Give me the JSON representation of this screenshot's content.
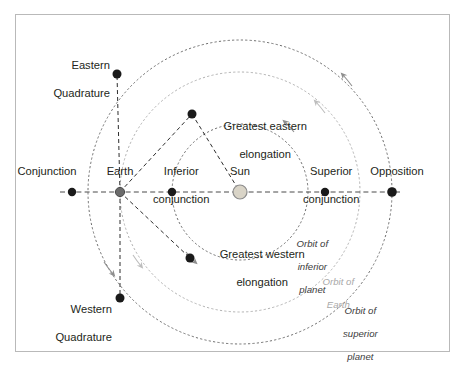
{
  "diagram": {
    "background_color": "#ffffff",
    "border_color": "#b9b9b9",
    "sun": {
      "label": "Sun",
      "fill_color": "#d9d4c7",
      "stroke_color": "#8c8c8c",
      "cx": 240,
      "cy": 192,
      "r": 7
    },
    "earth": {
      "label": "Earth",
      "color": "#6b6b6b",
      "cx": 120,
      "cy": 192,
      "r": 4.5
    },
    "orbits": [
      {
        "name": "orbit-inferior-planet",
        "label": "Orbit of\ninferior\nplanet",
        "label_line1": "Orbit of",
        "label_line2": "inferior",
        "label_line3": "planet",
        "color": "#707070",
        "radius": 68,
        "style": "dotted"
      },
      {
        "name": "orbit-earth",
        "label": "Orbit of\nEarth",
        "label_line1": "Orbit of",
        "label_line2": "Earth",
        "color": "#b2b2b2",
        "radius": 120,
        "style": "dotted"
      },
      {
        "name": "orbit-superior-planet",
        "label": "Orbit of\nsuperior\nplanet",
        "label_line1": "Orbit of",
        "label_line2": "superior",
        "label_line3": "planet",
        "color": "#707070",
        "radius": 152,
        "style": "dotted"
      }
    ],
    "orbit_direction": "counterclockwise",
    "points": [
      {
        "name": "conjunction",
        "label_line1": "Conjunction",
        "label_line2": "",
        "x": 72,
        "y": 192
      },
      {
        "name": "inferior-conjunction",
        "label_line1": "Inferior",
        "label_line2": "conjunction",
        "x": 172,
        "y": 192
      },
      {
        "name": "superior-conjunction",
        "label_line1": "Superior",
        "label_line2": "conjunction",
        "x": 325,
        "y": 192
      },
      {
        "name": "opposition",
        "label_line1": "Opposition",
        "label_line2": "",
        "x": 392,
        "y": 192
      },
      {
        "name": "eastern-quadrature",
        "label_line1": "Eastern",
        "label_line2": "Quadrature",
        "x": 117,
        "y": 74
      },
      {
        "name": "western-quadrature",
        "label_line1": "Western",
        "label_line2": "Quadrature",
        "x": 120,
        "y": 298
      },
      {
        "name": "greatest-eastern-elongation",
        "label_line1": "Greatest eastern",
        "label_line2": "elongation",
        "x": 192,
        "y": 114
      },
      {
        "name": "greatest-western-elongation",
        "label_line1": "Greatest western",
        "label_line2": "elongation",
        "x": 190,
        "y": 258
      }
    ],
    "point_color": "#1a1a1a",
    "sight_line_color": "#4a4a4a"
  }
}
